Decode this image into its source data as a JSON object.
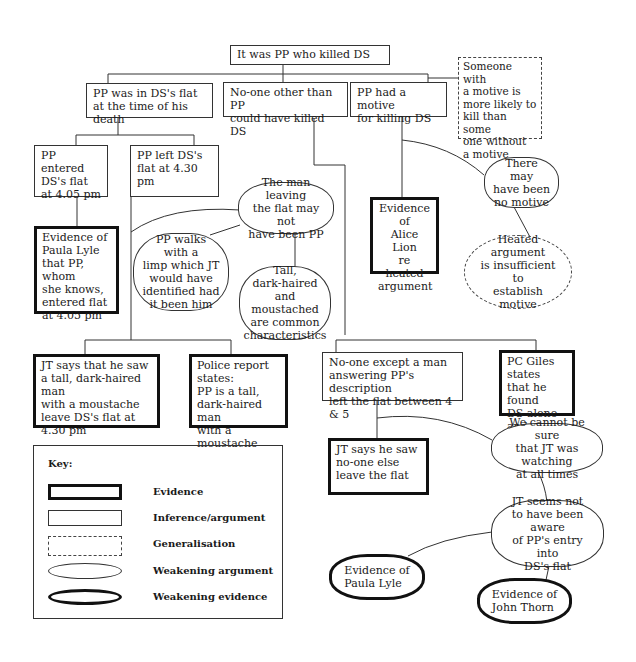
{
  "diagram": {
    "root": {
      "text": "It was PP who killed DS",
      "type": "inference"
    },
    "level1": [
      {
        "id": "in-flat",
        "text": "PP was in DS's flat\nat the time of his death",
        "type": "inference"
      },
      {
        "id": "no-one-other",
        "text": "No-one other than PP\ncould have killed DS",
        "type": "inference"
      },
      {
        "id": "motive",
        "text": "PP had a motive\nfor killing DS",
        "type": "inference"
      }
    ],
    "generalisation_motive": {
      "text": "Someone with\na motive is\nmore likely to\nkill than some\none without\na motive",
      "type": "generalisation"
    },
    "entered": {
      "text": "PP entered\nDS's flat\nat 4.05 pm",
      "type": "inference"
    },
    "left": {
      "text": "PP left DS's\nflat at 4.30 pm",
      "type": "inference"
    },
    "evidence_paula": {
      "text": "Evidence of\nPaula Lyle\nthat PP, whom\nshe knows,\nentered flat\nat 4.05 pm",
      "type": "evidence"
    },
    "man_leaving": {
      "text": "The man leaving\nthe flat may not\nhave been PP",
      "type": "weakening argument"
    },
    "limp": {
      "text": "PP walks with a\nlimp which JT\nwould have\nidentified had\nit been him",
      "type": "weakening argument"
    },
    "common": {
      "text": "Tall,\ndark-haired\nand moustached\nare common\ncharacteristics",
      "type": "weakening argument"
    },
    "evidence_alice": {
      "text": "Evidence\nof\nAlice Lion\nre heated\nargument",
      "type": "evidence"
    },
    "no_motive": {
      "text": "There may\nhave been\nno motive",
      "type": "weakening argument"
    },
    "heated": {
      "text": "Heated argument\nis insufficient to\nestablish\nmotive",
      "type": "weakening generalisation"
    },
    "jt_saw": {
      "text": "JT says that he saw\na tall, dark-haired man\nwith a moustache\nleave DS's flat at\n4.30 pm",
      "type": "evidence"
    },
    "police": {
      "text": "Police report\nstates:\nPP is a tall,\ndark-haired man\nwith a moustache",
      "type": "evidence"
    },
    "no_one_except": {
      "text": "No-one except a man\nanswering PP's description\nleft the flat between 4 & 5",
      "type": "inference"
    },
    "pc_giles": {
      "text": "PC Giles states\nthat he found\nDS alone and\ndead at 5 pm",
      "type": "evidence"
    },
    "jt_no_one": {
      "text": "JT says he saw\nno-one else\nleave the flat",
      "type": "evidence"
    },
    "cannot_sure": {
      "text": "We cannot be sure\nthat JT was watching\nat all times",
      "type": "weakening argument"
    },
    "jt_unaware": {
      "text": "JT seems not\nto have been aware\nof PP's entry into\nDS's flat",
      "type": "weakening argument"
    },
    "ev_paula_weak": {
      "text": "Evidence of\nPaula Lyle",
      "type": "weakening evidence"
    },
    "ev_john": {
      "text": "Evidence of\nJohn Thorn",
      "type": "weakening evidence"
    }
  },
  "key": {
    "title": "Key:",
    "items": [
      {
        "swatch": "thick-rectangle",
        "label": "Evidence"
      },
      {
        "swatch": "thin-rectangle",
        "label": "Inference/argument"
      },
      {
        "swatch": "dashed-rectangle",
        "label": "Generalisation"
      },
      {
        "swatch": "thin-ellipse",
        "label": "Weakening argument"
      },
      {
        "swatch": "thick-ellipse",
        "label": "Weakening evidence"
      }
    ]
  }
}
